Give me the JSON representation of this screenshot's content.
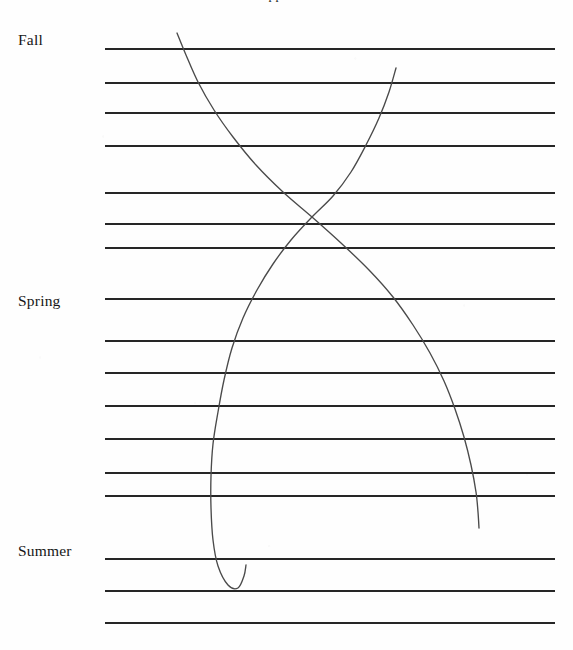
{
  "document": {
    "title_remnant": "Appendix",
    "page_background": "#fefefe",
    "rule_color": "#262626",
    "curve_color": "#4a4a4a"
  },
  "labels": [
    {
      "id": "fall",
      "text": "Fall",
      "x": 18,
      "y": 32
    },
    {
      "id": "spring",
      "text": "Spring",
      "x": 18,
      "y": 293
    },
    {
      "id": "summer",
      "text": "Summer",
      "x": 18,
      "y": 543
    }
  ],
  "chart_data": {
    "type": "line",
    "title": "Appendix",
    "xlabel": "",
    "ylabel": "",
    "grid": true,
    "legend": "none",
    "axis": {
      "y_category_labels": [
        "Fall",
        "Spring",
        "Summer"
      ],
      "y_label_rule_index": [
        0,
        7,
        14
      ],
      "x_range_px": [
        105,
        555
      ],
      "y_range_px": [
        48,
        622
      ]
    },
    "rule_lines": {
      "x_start": 105,
      "x_end": 555,
      "thickness": 2,
      "count": 18,
      "y_positions": [
        48,
        82,
        112,
        145,
        192,
        223,
        247,
        298,
        340,
        372,
        405,
        438,
        472,
        495,
        558,
        590,
        622,
        650
      ]
    },
    "series": [
      {
        "name": "descending-right-curve",
        "note": "Starts faint at upper-left near the Fall rule, sweeps down and right, crosses the other curve, continues to lower-right and ends with a short tail just below the rule at y=495.",
        "stroke_opacity_start": 0.35,
        "stroke_opacity_end": 0.85,
        "points_px": [
          [
            177,
            33
          ],
          [
            186,
            55
          ],
          [
            198,
            82
          ],
          [
            214,
            110
          ],
          [
            233,
            137
          ],
          [
            256,
            165
          ],
          [
            283,
            192
          ],
          [
            312,
            217
          ],
          [
            341,
            243
          ],
          [
            369,
            270
          ],
          [
            393,
            297
          ],
          [
            413,
            325
          ],
          [
            430,
            353
          ],
          [
            444,
            381
          ],
          [
            455,
            409
          ],
          [
            464,
            437
          ],
          [
            471,
            465
          ],
          [
            476,
            492
          ],
          [
            478,
            512
          ],
          [
            479,
            528
          ]
        ]
      },
      {
        "name": "descending-left-curve",
        "note": "Starts faint at the upper-right below the Fall rule, sweeps down and left, crosses the first curve, plunges nearly vertical, then hooks into a small U at the bottom near the Summer rule and returns up to the right.",
        "stroke_opacity_start": 0.35,
        "stroke_opacity_end": 0.85,
        "points_px": [
          [
            396,
            68
          ],
          [
            389,
            92
          ],
          [
            379,
            118
          ],
          [
            366,
            145
          ],
          [
            351,
            172
          ],
          [
            333,
            196
          ],
          [
            312,
            217
          ],
          [
            291,
            240
          ],
          [
            273,
            264
          ],
          [
            257,
            290
          ],
          [
            243,
            318
          ],
          [
            232,
            348
          ],
          [
            224,
            380
          ],
          [
            218,
            412
          ],
          [
            213,
            444
          ],
          [
            211,
            476
          ],
          [
            211,
            508
          ],
          [
            213,
            540
          ],
          [
            218,
            566
          ],
          [
            228,
            585
          ],
          [
            238,
            588
          ],
          [
            244,
            576
          ],
          [
            246,
            565
          ]
        ]
      }
    ]
  }
}
